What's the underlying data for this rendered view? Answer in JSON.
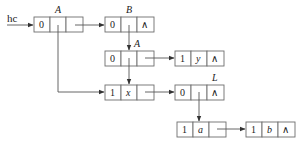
{
  "diagram": {
    "title": "",
    "head_pointer": {
      "label": "hc"
    },
    "nodes": [
      {
        "id": "A1",
        "label": "A",
        "cells": [
          "0",
          "",
          ""
        ],
        "x": 34,
        "y": 17
      },
      {
        "id": "B",
        "label": "B",
        "cells": [
          "0",
          "",
          "∧"
        ],
        "x": 105,
        "y": 17
      },
      {
        "id": "A2",
        "label": "A",
        "cells": [
          "0",
          "",
          ""
        ],
        "x": 105,
        "y": 51
      },
      {
        "id": "Y",
        "label": "",
        "cells": [
          "1",
          "y",
          "∧"
        ],
        "x": 175,
        "y": 51
      },
      {
        "id": "X",
        "label": "",
        "cells": [
          "1",
          "x",
          ""
        ],
        "x": 105,
        "y": 85
      },
      {
        "id": "L",
        "label": "L",
        "cells": [
          "0",
          "",
          "∧"
        ],
        "x": 175,
        "y": 85
      },
      {
        "id": "Ea",
        "label": "",
        "cells": [
          "1",
          "a",
          ""
        ],
        "x": 177,
        "y": 122
      },
      {
        "id": "Eb",
        "label": "",
        "cells": [
          "1",
          "b",
          "∧"
        ],
        "x": 246,
        "y": 122
      }
    ],
    "edges": [
      {
        "from": "hc",
        "to": "A1"
      },
      {
        "from": "A1.next",
        "to": "B"
      },
      {
        "from": "A1.sub",
        "to": "X"
      },
      {
        "from": "B.sub",
        "to": "A2"
      },
      {
        "from": "A2.next",
        "to": "Y"
      },
      {
        "from": "A2.sub",
        "to": "X.data"
      },
      {
        "from": "X.next",
        "to": "L"
      },
      {
        "from": "L.sub",
        "to": "Ea"
      },
      {
        "from": "Ea.next",
        "to": "Eb"
      }
    ],
    "colors": {
      "line": "#555555",
      "box": "#6e6e6e",
      "text": "#222222"
    }
  }
}
